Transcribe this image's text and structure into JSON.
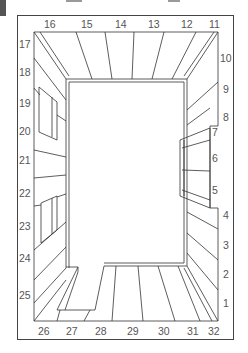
{
  "diagram": {
    "type": "room-perspective-panel-numbering",
    "top_labels": [
      {
        "text": "16",
        "x": 44,
        "y": 28
      },
      {
        "text": "15",
        "x": 81,
        "y": 28
      },
      {
        "text": "14",
        "x": 115,
        "y": 28
      },
      {
        "text": "13",
        "x": 148,
        "y": 28
      },
      {
        "text": "12",
        "x": 181,
        "y": 28
      },
      {
        "text": "11",
        "x": 209,
        "y": 28
      }
    ],
    "left_labels": [
      {
        "text": "17",
        "x": 19,
        "y": 48
      },
      {
        "text": "18",
        "x": 19,
        "y": 76
      },
      {
        "text": "19",
        "x": 19,
        "y": 107
      },
      {
        "text": "20",
        "x": 19,
        "y": 135
      },
      {
        "text": "21",
        "x": 19,
        "y": 164
      },
      {
        "text": "22",
        "x": 19,
        "y": 197
      },
      {
        "text": "23",
        "x": 19,
        "y": 230
      },
      {
        "text": "24",
        "x": 19,
        "y": 262
      },
      {
        "text": "25",
        "x": 19,
        "y": 299
      }
    ],
    "right_labels": [
      {
        "text": "10",
        "x": 222,
        "y": 62
      },
      {
        "text": "9",
        "x": 224,
        "y": 93
      },
      {
        "text": "8",
        "x": 224,
        "y": 121
      },
      {
        "text": "7",
        "x": 211,
        "y": 136
      },
      {
        "text": "6",
        "x": 211,
        "y": 162
      },
      {
        "text": "5",
        "x": 211,
        "y": 194
      },
      {
        "text": "4",
        "x": 224,
        "y": 219
      },
      {
        "text": "3",
        "x": 224,
        "y": 249
      },
      {
        "text": "2",
        "x": 224,
        "y": 278
      },
      {
        "text": "1",
        "x": 224,
        "y": 307
      }
    ],
    "bottom_labels": [
      {
        "text": "26",
        "x": 38,
        "y": 335
      },
      {
        "text": "27",
        "x": 66,
        "y": 335
      },
      {
        "text": "28",
        "x": 95,
        "y": 335
      },
      {
        "text": "29",
        "x": 127,
        "y": 335
      },
      {
        "text": "30",
        "x": 158,
        "y": 335
      },
      {
        "text": "31",
        "x": 187,
        "y": 335
      },
      {
        "text": "32",
        "x": 208,
        "y": 335
      }
    ],
    "line_color": "#333333",
    "label_color": "#555555"
  }
}
